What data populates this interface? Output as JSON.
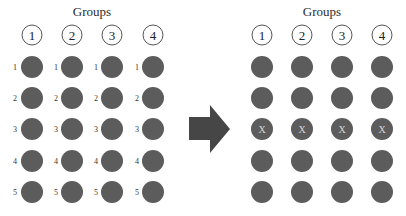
{
  "left": {
    "title": "Groups",
    "groups": [
      "1",
      "2",
      "3",
      "4"
    ],
    "row_labels": [
      "1",
      "2",
      "3",
      "4",
      "5"
    ],
    "rows": 5
  },
  "arrow": {
    "direction": "right",
    "color": "#464646"
  },
  "right": {
    "title": "Groups",
    "groups": [
      "1",
      "2",
      "3",
      "4"
    ],
    "rows": 5,
    "marked_row_index": 2,
    "mark_label": "X"
  },
  "colors": {
    "dot": "#5c5c5c",
    "mark": "#d8d8d8",
    "outline": "#555555"
  }
}
